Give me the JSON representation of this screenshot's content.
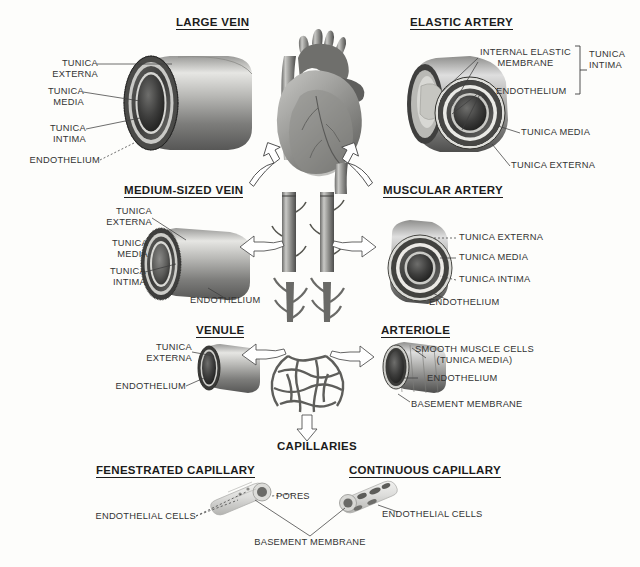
{
  "diagram": {
    "background_color": "#fdfdfb",
    "text_color": "#333333",
    "heading_color": "#1c1c1c"
  },
  "sections": {
    "large_vein": {
      "heading": "LARGE VEIN",
      "labels": {
        "tunica_externa": "TUNICA\nEXTERNA",
        "tunica_externa_line1": "TUNICA",
        "tunica_externa_line2": "EXTERNA",
        "tunica_media_line1": "TUNICA",
        "tunica_media_line2": "MEDIA",
        "tunica_intima_line1": "TUNICA",
        "tunica_intima_line2": "INTIMA",
        "endothelium": "ENDOTHELIUM"
      }
    },
    "elastic_artery": {
      "heading": "ELASTIC ARTERY",
      "labels": {
        "internal_elastic_membrane_line1": "INTERNAL ELASTIC",
        "internal_elastic_membrane_line2": "MEMBRANE",
        "endothelium": "ENDOTHELIUM",
        "tunica_intima_line1": "TUNICA",
        "tunica_intima_line2": "INTIMA",
        "tunica_media": "TUNICA MEDIA",
        "tunica_externa": "TUNICA EXTERNA"
      }
    },
    "medium_sized_vein": {
      "heading": "MEDIUM-SIZED VEIN",
      "labels": {
        "tunica_externa_line1": "TUNICA",
        "tunica_externa_line2": "EXTERNA",
        "tunica_media_line1": "TUNICA",
        "tunica_media_line2": "MEDIA",
        "tunica_intima_line1": "TUNICA",
        "tunica_intima_line2": "INTIMA",
        "endothelium": "ENDOTHELIUM"
      }
    },
    "muscular_artery": {
      "heading": "MUSCULAR ARTERY",
      "labels": {
        "tunica_externa": "TUNICA EXTERNA",
        "tunica_media": "TUNICA MEDIA",
        "tunica_intima": "TUNICA INTIMA",
        "endothelium": "ENDOTHELIUM"
      }
    },
    "venule": {
      "heading": "VENULE",
      "labels": {
        "tunica_externa_line1": "TUNICA",
        "tunica_externa_line2": "EXTERNA",
        "endothelium": "ENDOTHELIUM"
      }
    },
    "arteriole": {
      "heading": "ARTERIOLE",
      "labels": {
        "smooth_muscle_cells_line1": "SMOOTH MUSCLE CELLS",
        "smooth_muscle_cells_line2": "(TUNICA MEDIA)",
        "endothelium": "ENDOTHELIUM",
        "basement_membrane": "BASEMENT MEMBRANE"
      }
    },
    "capillaries": {
      "heading": "CAPILLARIES",
      "fenestrated": {
        "heading": "FENESTRATED CAPILLARY",
        "labels": {
          "endothelial_cells": "ENDOTHELIAL CELLS",
          "pores": "PORES"
        }
      },
      "continuous": {
        "heading": "CONTINUOUS CAPILLARY",
        "labels": {
          "endothelial_cells": "ENDOTHELIAL CELLS"
        }
      },
      "shared_labels": {
        "basement_membrane": "BASEMENT MEMBRANE"
      }
    },
    "central": {
      "heart_label": "heart-illustration",
      "vein_trunk_label": "vein-trunk",
      "artery_trunk_label": "artery-trunk",
      "capillary_bed_label": "capillary-bed"
    }
  },
  "icons": {
    "flow_arrow": "curved-outline-arrow",
    "down_arrow": "down-outline-arrow",
    "bracket": "grouping-bracket"
  }
}
